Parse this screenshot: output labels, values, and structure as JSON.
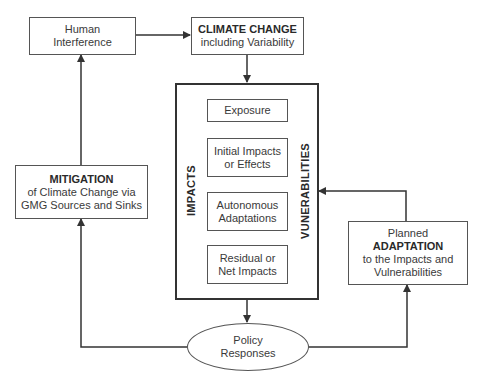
{
  "diagram": {
    "nodes": {
      "human_interference": {
        "line1": "Human",
        "line2": "Interference"
      },
      "climate_change": {
        "title": "CLIMATE CHANGE",
        "subtitle": "including Variability"
      },
      "impacts_label": "IMPACTS",
      "vulnerabilities_label": "VUNERABILITIES",
      "exposure": {
        "line1": "Exposure"
      },
      "initial_impacts": {
        "line1": "Initial Impacts",
        "line2": "or Effects"
      },
      "autonomous_adaptations": {
        "line1": "Autonomous",
        "line2": "Adaptations"
      },
      "residual_impacts": {
        "line1": "Residual or",
        "line2": "Net Impacts"
      },
      "mitigation": {
        "title": "MITIGATION",
        "line1": "of Climate Change via",
        "line2": "GMG Sources and Sinks"
      },
      "adaptation": {
        "pre": "Planned",
        "title": "ADAPTATION",
        "line1": "to the Impacts and",
        "line2": "Vulnerabilities"
      },
      "policy_responses": {
        "line1": "Policy",
        "line2": "Responses"
      }
    },
    "edges": [
      {
        "from": "Human Interference",
        "to": "CLIMATE CHANGE"
      },
      {
        "from": "CLIMATE CHANGE",
        "to": "IMPACTS/VULNERABILITIES"
      },
      {
        "from": "IMPACTS/VULNERABILITIES",
        "to": "Policy Responses"
      },
      {
        "from": "Policy Responses",
        "to": "MITIGATION"
      },
      {
        "from": "MITIGATION",
        "to": "Human Interference"
      },
      {
        "from": "Policy Responses",
        "to": "ADAPTATION"
      },
      {
        "from": "ADAPTATION",
        "to": "IMPACTS/VULNERABILITIES"
      }
    ],
    "colors": {
      "line": "#333333",
      "text": "#333333",
      "background": "#ffffff"
    }
  }
}
